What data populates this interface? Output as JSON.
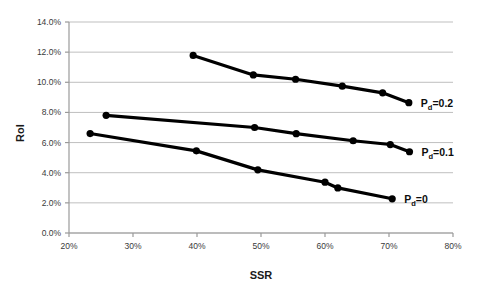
{
  "chart_data": {
    "type": "line",
    "title": "",
    "xlabel": "SSR",
    "ylabel": "RoI",
    "xlim": [
      0.2,
      0.8
    ],
    "ylim": [
      0.0,
      0.14
    ],
    "grid": true,
    "grid_axis": "y",
    "legend": "inline-right-of-series",
    "x_tick_labels": [
      "20%",
      "30%",
      "40%",
      "50%",
      "60%",
      "70%",
      "80%"
    ],
    "x_tick_values": [
      0.2,
      0.3,
      0.4,
      0.5,
      0.6,
      0.7,
      0.8
    ],
    "y_tick_labels": [
      "0.0%",
      "2.0%",
      "4.0%",
      "6.0%",
      "8.0%",
      "10.0%",
      "12.0%",
      "14.0%"
    ],
    "y_tick_values": [
      0.0,
      0.02,
      0.04,
      0.06,
      0.08,
      0.1,
      0.12,
      0.14
    ],
    "marker": "circle-filled",
    "line_color": "#000000",
    "grid_color": "#bfbfbf",
    "axis_color": "#9a9a9a",
    "series": [
      {
        "name": "Pd=0.2",
        "label_main": "P",
        "label_sub": "d",
        "label_tail": "=0.2",
        "points": [
          {
            "x": 0.394,
            "y": 0.1178
          },
          {
            "x": 0.488,
            "y": 0.1049
          },
          {
            "x": 0.554,
            "y": 0.102
          },
          {
            "x": 0.627,
            "y": 0.0974
          },
          {
            "x": 0.69,
            "y": 0.093
          },
          {
            "x": 0.731,
            "y": 0.0865
          }
        ]
      },
      {
        "name": "Pd=0.1",
        "label_main": "P",
        "label_sub": "d",
        "label_tail": "=0.1",
        "points": [
          {
            "x": 0.258,
            "y": 0.0781
          },
          {
            "x": 0.49,
            "y": 0.07
          },
          {
            "x": 0.555,
            "y": 0.0659
          },
          {
            "x": 0.644,
            "y": 0.0612
          },
          {
            "x": 0.702,
            "y": 0.0587
          },
          {
            "x": 0.732,
            "y": 0.0539
          }
        ]
      },
      {
        "name": "Pd=0",
        "label_main": "P",
        "label_sub": "d",
        "label_tail": "=0",
        "points": [
          {
            "x": 0.233,
            "y": 0.066
          },
          {
            "x": 0.399,
            "y": 0.0545
          },
          {
            "x": 0.495,
            "y": 0.0419
          },
          {
            "x": 0.6,
            "y": 0.0337
          },
          {
            "x": 0.62,
            "y": 0.0299
          },
          {
            "x": 0.705,
            "y": 0.0227
          }
        ]
      }
    ]
  },
  "axis": {
    "x_title": "SSR",
    "y_title": "RoI"
  }
}
